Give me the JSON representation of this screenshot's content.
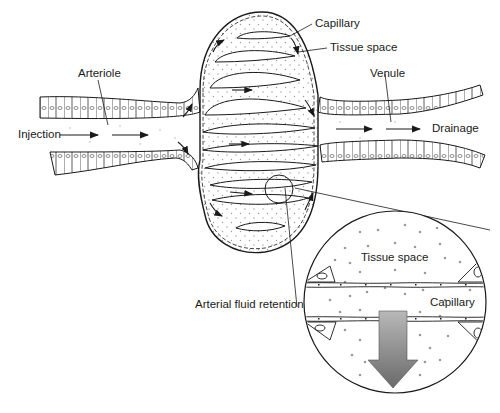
{
  "diagram": {
    "labels": {
      "arteriole": "Arteriole",
      "injection": "Injection",
      "capillary_top": "Capillary",
      "tissue_space_top": "Tissue space",
      "venule": "Venule",
      "drainage": "Drainage",
      "tissue_space_inset": "Tissue space",
      "capillary_inset": "Capillary",
      "arterial_fluid_retention": "Arterial fluid retention"
    },
    "colors": {
      "line": "#1a1a1a",
      "dots": "#888888",
      "arrow_gradient_top": "#b5b5b5",
      "arrow_gradient_bottom": "#6e6e6e",
      "background": "#ffffff"
    }
  }
}
